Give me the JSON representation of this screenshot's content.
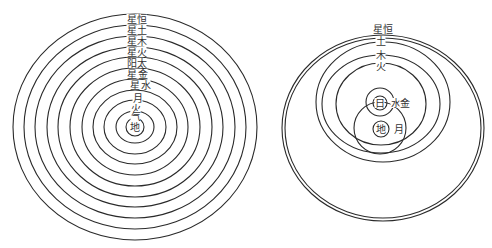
{
  "figure": {
    "left": {
      "title": "Geocentric model (Ptolemaic)",
      "center": [
        135,
        127
      ],
      "rings": [
        {
          "rx": 122,
          "ry": 113
        },
        {
          "rx": 111,
          "ry": 102
        },
        {
          "rx": 100,
          "ry": 91
        },
        {
          "rx": 88,
          "ry": 80
        },
        {
          "rx": 77,
          "ry": 70
        },
        {
          "rx": 65,
          "ry": 59
        },
        {
          "rx": 53,
          "ry": 48
        },
        {
          "rx": 42,
          "ry": 37
        },
        {
          "rx": 31,
          "ry": 27
        },
        {
          "rx": 19,
          "ry": 16
        },
        {
          "rx": 9,
          "ry": 9
        }
      ],
      "labels": [
        {
          "text": "恒",
          "x": 137,
          "y": 23
        },
        {
          "text": "星",
          "x": 127,
          "y": 23
        },
        {
          "text": "土",
          "x": 137,
          "y": 34
        },
        {
          "text": "星",
          "x": 127,
          "y": 34
        },
        {
          "text": "木",
          "x": 137,
          "y": 45
        },
        {
          "text": "星",
          "x": 127,
          "y": 45
        },
        {
          "text": "火",
          "x": 137,
          "y": 56
        },
        {
          "text": "星",
          "x": 127,
          "y": 56
        },
        {
          "text": "太",
          "x": 137,
          "y": 67
        },
        {
          "text": "阳",
          "x": 127,
          "y": 67
        },
        {
          "text": "金",
          "x": 138,
          "y": 78
        },
        {
          "text": "星",
          "x": 127,
          "y": 78
        },
        {
          "text": "水",
          "x": 141,
          "y": 89
        },
        {
          "text": "星",
          "x": 130,
          "y": 89
        },
        {
          "text": "月",
          "x": 133,
          "y": 102
        },
        {
          "text": "火",
          "x": 131,
          "y": 112
        },
        {
          "text": "气",
          "x": 131,
          "y": 120
        },
        {
          "text": "地",
          "x": 130,
          "y": 131
        }
      ]
    },
    "right": {
      "title": "Tychonic model",
      "outer_double": [
        {
          "cx": 383,
          "cy": 128,
          "rx": 101,
          "ry": 93
        },
        {
          "cx": 383,
          "cy": 128,
          "rx": 98,
          "ry": 90
        }
      ],
      "rings": [
        {
          "name": "土",
          "cx": 383,
          "cy": 102,
          "rx": 67,
          "ry": 60
        },
        {
          "name": "木",
          "cx": 381,
          "cy": 104,
          "rx": 59,
          "ry": 49
        },
        {
          "name": "火",
          "cx": 381,
          "cy": 104,
          "rx": 45,
          "ry": 41
        },
        {
          "name": "水金",
          "cx": 380,
          "cy": 102,
          "rx": 14,
          "ry": 14
        },
        {
          "name": "日",
          "cx": 380,
          "cy": 103,
          "rx": 7,
          "ry": 7
        },
        {
          "name": "月",
          "cx": 380,
          "cy": 128,
          "rx": 26,
          "ry": 26
        },
        {
          "name": "地",
          "cx": 381,
          "cy": 129,
          "rx": 8,
          "ry": 8
        }
      ],
      "labels": [
        {
          "text": "星",
          "x": 373,
          "y": 33
        },
        {
          "text": "恒",
          "x": 383,
          "y": 33
        },
        {
          "text": "土",
          "x": 376,
          "y": 45
        },
        {
          "text": "木",
          "x": 376,
          "y": 59
        },
        {
          "text": "火",
          "x": 376,
          "y": 70
        },
        {
          "text": "日",
          "x": 375,
          "y": 107
        },
        {
          "text": "水",
          "x": 391,
          "y": 107
        },
        {
          "text": "金",
          "x": 400,
          "y": 107
        },
        {
          "text": "地",
          "x": 376,
          "y": 133
        },
        {
          "text": "月",
          "x": 394,
          "y": 133
        }
      ]
    }
  }
}
